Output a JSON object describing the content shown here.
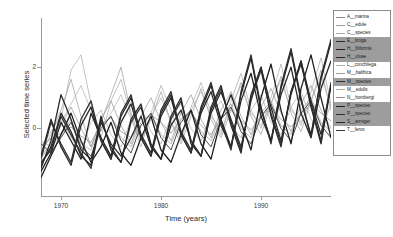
{
  "chart_data": {
    "type": "line",
    "title": "",
    "xlabel": "Time (years)",
    "ylabel": "Selected time series",
    "xlim": [
      1968,
      1997
    ],
    "ylim": [
      -2.2,
      3.6
    ],
    "xticks": [
      1970,
      1980,
      1990
    ],
    "xticklabels": [
      "1970",
      "1980",
      "1990"
    ],
    "yticks": [
      0,
      2
    ],
    "yticklabels": [
      "0",
      "2"
    ],
    "grid": false,
    "legend_position": "right-outside",
    "x": [
      1968,
      1969,
      1970,
      1971,
      1972,
      1973,
      1974,
      1975,
      1976,
      1977,
      1978,
      1979,
      1980,
      1981,
      1982,
      1983,
      1984,
      1985,
      1986,
      1987,
      1988,
      1989,
      1990,
      1991,
      1992,
      1993,
      1994,
      1995,
      1996,
      1997
    ],
    "series": [
      {
        "name": "A__marina",
        "color": "#8a8a8a",
        "width": 0.7,
        "highlighted": false,
        "values": [
          -0.55,
          -0.35,
          -0.15,
          0.05,
          -0.25,
          -0.45,
          0.15,
          0.35,
          -0.1,
          -0.3,
          0.1,
          0.45,
          0.2,
          -0.15,
          0.3,
          0.5,
          0.1,
          -0.2,
          0.35,
          0.6,
          0.25,
          -0.05,
          0.4,
          0.7,
          0.3,
          0.05,
          0.45,
          0.8,
          0.5,
          0.25
        ]
      },
      {
        "name": "C__edule",
        "color": "#9a9a9a",
        "width": 0.7,
        "highlighted": false,
        "values": [
          -0.8,
          -0.2,
          0.6,
          1.6,
          0.4,
          -0.6,
          0.2,
          1.1,
          2.0,
          0.5,
          -0.4,
          0.3,
          1.2,
          0.2,
          -0.5,
          0.4,
          1.3,
          0.3,
          -0.3,
          0.6,
          1.5,
          0.4,
          -0.2,
          0.8,
          1.7,
          0.5,
          -0.1,
          0.9,
          1.9,
          0.6
        ]
      },
      {
        "name": "C__species",
        "color": "#a8a8a8",
        "width": 0.7,
        "highlighted": false,
        "values": [
          -1.0,
          -0.5,
          0.3,
          1.9,
          2.4,
          0.8,
          -0.3,
          0.9,
          1.6,
          0.4,
          -0.6,
          0.5,
          1.4,
          0.6,
          -0.4,
          0.7,
          1.5,
          0.5,
          -0.2,
          0.9,
          1.8,
          0.6,
          0.0,
          1.0,
          2.1,
          0.7,
          0.1,
          1.2,
          2.3,
          0.8
        ]
      },
      {
        "name": "E__longa",
        "color": "#2a2a2a",
        "width": 1.3,
        "highlighted": true,
        "values": [
          -1.3,
          -0.4,
          1.1,
          0.3,
          -0.7,
          -1.0,
          0.2,
          -0.5,
          -0.9,
          -0.3,
          0.4,
          -0.6,
          -1.0,
          0.1,
          0.6,
          -0.4,
          -0.9,
          0.5,
          1.2,
          0.3,
          -0.6,
          0.9,
          2.0,
          0.7,
          -0.4,
          1.1,
          2.2,
          0.9,
          -0.2,
          1.4
        ]
      },
      {
        "name": "H__filiformis",
        "color": "#1f1f1f",
        "width": 1.3,
        "highlighted": true,
        "values": [
          -1.6,
          -0.9,
          -0.2,
          0.5,
          -0.4,
          -1.1,
          -0.6,
          0.2,
          -0.8,
          -1.2,
          -0.3,
          0.4,
          -0.7,
          -1.1,
          -0.2,
          0.6,
          -0.5,
          -1.0,
          0.3,
          1.1,
          0.2,
          -0.7,
          1.0,
          2.1,
          0.6,
          -0.5,
          1.3,
          2.4,
          1.0,
          -0.3
        ]
      },
      {
        "name": "H__ulvae",
        "color": "#262626",
        "width": 1.3,
        "highlighted": true,
        "values": [
          -0.9,
          0.3,
          -0.6,
          -1.2,
          0.1,
          0.7,
          -0.4,
          -1.0,
          0.2,
          0.8,
          -0.3,
          -0.9,
          0.4,
          1.0,
          -0.2,
          -0.8,
          0.5,
          1.2,
          0.1,
          -0.6,
          0.9,
          1.8,
          0.4,
          -0.4,
          1.1,
          2.0,
          0.5,
          -0.3,
          1.3,
          2.2
        ]
      },
      {
        "name": "L__conchilega",
        "color": "#b0b0b0",
        "width": 0.7,
        "highlighted": false,
        "values": [
          -0.7,
          -0.3,
          0.2,
          0.8,
          1.4,
          0.6,
          -0.1,
          0.5,
          1.1,
          0.3,
          -0.4,
          0.4,
          1.0,
          0.2,
          -0.3,
          0.6,
          1.2,
          0.4,
          -0.1,
          0.7,
          1.4,
          0.5,
          0.1,
          0.8,
          1.6,
          0.6,
          0.2,
          0.9,
          1.7,
          0.7
        ]
      },
      {
        "name": "M__balthica",
        "color": "#9e9e9e",
        "width": 0.7,
        "highlighted": false,
        "values": [
          -0.4,
          -0.6,
          -0.2,
          0.3,
          -0.5,
          -0.7,
          0.1,
          0.4,
          -0.3,
          -0.6,
          0.2,
          0.5,
          -0.2,
          -0.5,
          0.3,
          0.6,
          -0.1,
          -0.4,
          0.4,
          0.8,
          0.0,
          -0.3,
          0.5,
          0.9,
          0.1,
          -0.2,
          0.6,
          1.0,
          0.2,
          -0.1
        ]
      },
      {
        "name": "M__species",
        "color": "#333333",
        "width": 1.3,
        "highlighted": true,
        "values": [
          -1.1,
          -0.7,
          0.4,
          -0.2,
          -0.8,
          -1.3,
          0.3,
          -0.6,
          -1.1,
          0.2,
          0.7,
          -0.5,
          -1.0,
          0.3,
          0.9,
          -0.4,
          -0.9,
          0.6,
          1.3,
          0.2,
          -0.7,
          1.0,
          1.9,
          0.5,
          -0.5,
          1.2,
          2.1,
          0.8,
          -0.4,
          1.5
        ]
      },
      {
        "name": "M__edulis",
        "color": "#aaaaaa",
        "width": 0.7,
        "highlighted": false,
        "values": [
          -0.6,
          -0.1,
          0.4,
          -0.3,
          -0.7,
          0.2,
          0.6,
          -0.2,
          -0.6,
          0.3,
          0.7,
          -0.1,
          -0.5,
          0.4,
          0.8,
          0.0,
          -0.4,
          0.5,
          0.9,
          0.1,
          -0.3,
          0.6,
          1.1,
          0.2,
          -0.2,
          0.7,
          1.2,
          0.3,
          -0.1,
          0.8
        ]
      },
      {
        "name": "N__hombergi",
        "color": "#949494",
        "width": 0.7,
        "highlighted": false,
        "values": [
          -0.9,
          -0.5,
          0.1,
          0.7,
          0.0,
          -0.6,
          0.3,
          0.9,
          0.1,
          -0.5,
          0.4,
          1.0,
          0.2,
          -0.4,
          0.5,
          1.1,
          0.3,
          -0.3,
          0.6,
          1.2,
          0.4,
          -0.2,
          0.7,
          1.3,
          0.5,
          -0.1,
          0.8,
          1.4,
          0.6,
          0.0
        ]
      },
      {
        "name": "P__species",
        "color": "#222222",
        "width": 1.3,
        "highlighted": true,
        "values": [
          -1.4,
          -0.8,
          0.2,
          -0.4,
          -1.0,
          0.5,
          -0.3,
          -0.9,
          0.4,
          1.0,
          -0.2,
          -0.8,
          0.5,
          1.1,
          -0.1,
          -0.7,
          0.6,
          1.4,
          0.3,
          -0.6,
          1.1,
          2.3,
          0.6,
          -0.4,
          1.3,
          2.5,
          0.9,
          -0.2,
          1.6,
          2.8
        ]
      },
      {
        "name": "P__species",
        "color": "#2e2e2e",
        "width": 1.3,
        "highlighted": true,
        "values": [
          -1.0,
          0.2,
          -0.5,
          -1.1,
          0.3,
          0.9,
          -0.4,
          -1.0,
          0.5,
          1.1,
          -0.3,
          -0.9,
          0.6,
          1.2,
          -0.2,
          -0.8,
          0.7,
          1.5,
          0.2,
          -0.7,
          1.2,
          2.4,
          0.7,
          -0.5,
          1.4,
          2.6,
          1.0,
          -0.3,
          1.7,
          2.9
        ]
      },
      {
        "name": "S__armiger",
        "color": "#282828",
        "width": 1.3,
        "highlighted": true,
        "values": [
          -1.2,
          -0.6,
          0.5,
          -0.1,
          -0.9,
          -1.2,
          0.4,
          -0.7,
          -1.1,
          0.3,
          0.8,
          -0.6,
          -1.0,
          0.4,
          1.0,
          -0.5,
          -0.9,
          0.7,
          1.4,
          0.1,
          -0.8,
          1.1,
          2.0,
          0.4,
          -0.6,
          1.2,
          2.2,
          0.7,
          -0.5,
          1.4
        ]
      },
      {
        "name": "T__ferox",
        "color": "#3b3b3b",
        "width": 0.9,
        "highlighted": false,
        "values": [
          -0.5,
          -0.8,
          -0.3,
          0.2,
          -0.6,
          -0.9,
          0.0,
          0.4,
          -0.4,
          -0.8,
          0.1,
          0.5,
          -0.3,
          -0.7,
          0.2,
          0.6,
          -0.2,
          -0.6,
          0.3,
          0.7,
          -0.1,
          -0.5,
          0.4,
          0.8,
          0.0,
          -0.4,
          0.5,
          0.9,
          0.1,
          -0.3
        ]
      }
    ]
  },
  "axes": {
    "y_title": "Selected time series",
    "x_title": "Time (years)",
    "y_tick_labels": [
      "0",
      "2"
    ],
    "x_tick_labels": [
      "1970",
      "1980",
      "1990"
    ]
  },
  "legend": {
    "items": [
      {
        "label": "A__marina",
        "color": "#8a8a8a",
        "highlighted": false
      },
      {
        "label": "C__edule",
        "color": "#9a9a9a",
        "highlighted": false
      },
      {
        "label": "C__species",
        "color": "#a8a8a8",
        "highlighted": false
      },
      {
        "label": "E__longa",
        "color": "#2a2a2a",
        "highlighted": true
      },
      {
        "label": "H__filiformis",
        "color": "#1f1f1f",
        "highlighted": true
      },
      {
        "label": "H__ulvae",
        "color": "#262626",
        "highlighted": true
      },
      {
        "label": "L__conchilega",
        "color": "#b0b0b0",
        "highlighted": false
      },
      {
        "label": "M__balthica",
        "color": "#9e9e9e",
        "highlighted": false
      },
      {
        "label": "M__species",
        "color": "#333333",
        "highlighted": true
      },
      {
        "label": "M__edulis",
        "color": "#aaaaaa",
        "highlighted": false
      },
      {
        "label": "N__hombergi",
        "color": "#949494",
        "highlighted": false
      },
      {
        "label": "P__species",
        "color": "#222222",
        "highlighted": true
      },
      {
        "label": "P__species",
        "color": "#2e2e2e",
        "highlighted": true
      },
      {
        "label": "S__armiger",
        "color": "#282828",
        "highlighted": true
      },
      {
        "label": "T__ferox",
        "color": "#3b3b3b",
        "highlighted": false
      }
    ]
  }
}
